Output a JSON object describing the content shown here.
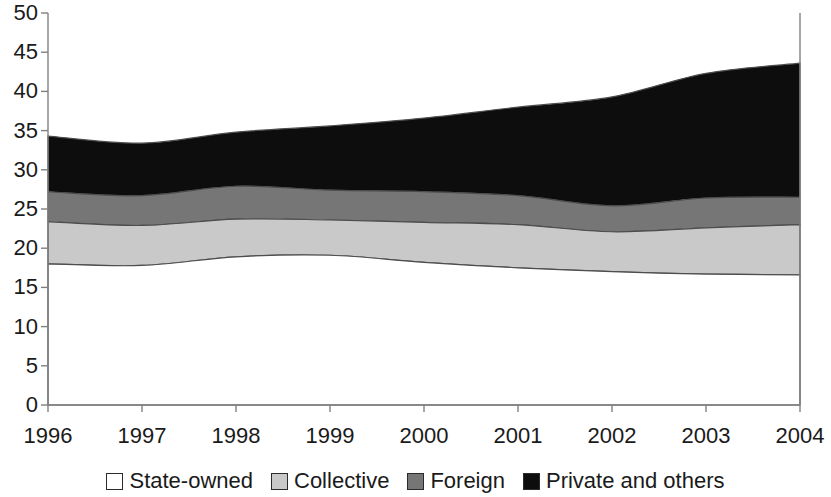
{
  "chart_data": {
    "type": "area",
    "title": "",
    "subtitle": "",
    "xlabel": "",
    "ylabel": "",
    "stacked": true,
    "grid": false,
    "legend_position": "bottom",
    "xlim": [
      1996,
      2004
    ],
    "ylim": [
      0,
      50
    ],
    "y_ticks": [
      0,
      5,
      10,
      15,
      20,
      25,
      30,
      35,
      40,
      45,
      50
    ],
    "y_tick_labels": [
      "0",
      "5",
      "10",
      "15",
      "20",
      "25",
      "30",
      "35",
      "40",
      "45",
      "50"
    ],
    "categories": [
      1996,
      1997,
      1998,
      1999,
      2000,
      2001,
      2002,
      2003,
      2004
    ],
    "x_tick_labels": [
      "1996",
      "1997",
      "1998",
      "1999",
      "2000",
      "2001",
      "2002",
      "2003",
      "2004"
    ],
    "series": [
      {
        "name": "State-owned",
        "color": "#ffffff",
        "values": [
          18.0,
          17.8,
          18.9,
          19.1,
          18.2,
          17.5,
          17.0,
          16.7,
          16.6
        ],
        "cumulative": [
          18.0,
          17.8,
          18.9,
          19.1,
          18.2,
          17.5,
          17.0,
          16.7,
          16.6
        ]
      },
      {
        "name": "Collective",
        "color": "#c9c9c9",
        "values": [
          5.4,
          5.1,
          4.8,
          4.5,
          5.1,
          5.5,
          5.1,
          5.9,
          6.4
        ],
        "cumulative": [
          23.4,
          22.9,
          23.7,
          23.6,
          23.3,
          23.0,
          22.1,
          22.6,
          23.0
        ]
      },
      {
        "name": "Foreign",
        "color": "#767676",
        "values": [
          3.8,
          3.8,
          4.2,
          3.8,
          3.9,
          3.7,
          3.3,
          3.8,
          3.5
        ],
        "cumulative": [
          27.2,
          26.7,
          27.9,
          27.4,
          27.2,
          26.7,
          25.4,
          26.4,
          26.5
        ]
      },
      {
        "name": "Private and others",
        "color": "#0d0d0d",
        "values": [
          7.1,
          6.7,
          6.9,
          8.2,
          9.4,
          11.3,
          13.9,
          15.9,
          17.1
        ],
        "cumulative": [
          34.3,
          33.4,
          34.8,
          35.6,
          36.6,
          38.0,
          39.3,
          42.3,
          43.6
        ]
      }
    ]
  },
  "legend": {
    "items": [
      {
        "label": "State-owned",
        "color": "#ffffff"
      },
      {
        "label": "Collective",
        "color": "#c9c9c9"
      },
      {
        "label": "Foreign",
        "color": "#767676"
      },
      {
        "label": "Private and others",
        "color": "#0d0d0d"
      }
    ]
  },
  "axis": {
    "line_color": "#808080"
  }
}
